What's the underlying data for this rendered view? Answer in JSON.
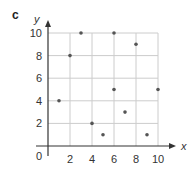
{
  "panel_label": "c",
  "chart_data": {
    "type": "scatter",
    "title": "",
    "xlabel": "x",
    "ylabel": "y",
    "origin_label": "0",
    "xlim": [
      0,
      10
    ],
    "ylim": [
      0,
      10
    ],
    "x_ticks": [
      2,
      4,
      6,
      8,
      10
    ],
    "y_ticks": [
      2,
      4,
      6,
      8,
      10
    ],
    "grid": true,
    "points": [
      {
        "x": 1,
        "y": 4
      },
      {
        "x": 2,
        "y": 8
      },
      {
        "x": 3,
        "y": 10
      },
      {
        "x": 4,
        "y": 2
      },
      {
        "x": 5,
        "y": 1
      },
      {
        "x": 6,
        "y": 10
      },
      {
        "x": 6,
        "y": 5
      },
      {
        "x": 7,
        "y": 3
      },
      {
        "x": 8,
        "y": 9
      },
      {
        "x": 9,
        "y": 1
      },
      {
        "x": 10,
        "y": 5
      }
    ],
    "colors": {
      "point": "#555555",
      "grid": "#cccccc",
      "axis": "#333333"
    }
  }
}
